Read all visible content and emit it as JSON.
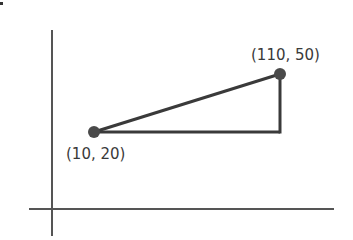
{
  "diagram": {
    "type": "coordinate-triangle",
    "points": [
      {
        "label": "(10, 20)",
        "x": 10,
        "y": 20
      },
      {
        "label": "(110, 50)",
        "x": 110,
        "y": 50
      }
    ],
    "colors": {
      "axis": "#555555",
      "line": "#3a3a3a",
      "point": "#4a4a4a",
      "text": "#3a3a3a"
    }
  }
}
